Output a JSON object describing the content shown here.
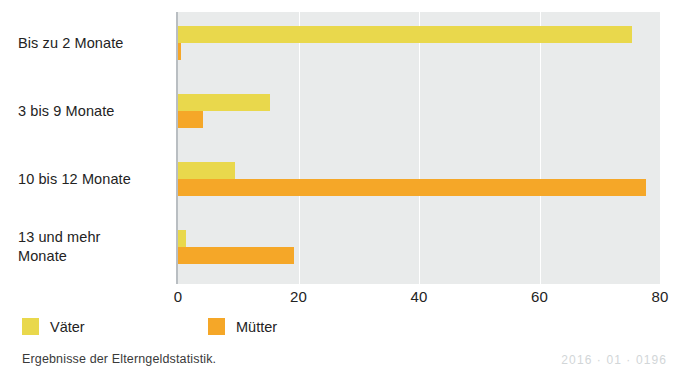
{
  "chart_data": {
    "type": "bar",
    "orientation": "horizontal",
    "title": "",
    "xlabel": "",
    "ylabel": "",
    "categories": [
      "Bis zu 2 Monate",
      "3 bis 9 Monate",
      "10 bis 12 Monate",
      "13 und mehr\nMonate"
    ],
    "series": [
      {
        "name": "Väter",
        "color": "#e9d84c",
        "values": [
          75.3,
          15.2,
          9.5,
          1.3
        ]
      },
      {
        "name": "Mütter",
        "color": "#f5a728",
        "values": [
          0.5,
          4.2,
          77.7,
          19.2
        ]
      }
    ],
    "xlim": [
      0,
      80
    ],
    "xticks": [
      "0",
      "20",
      "40",
      "60",
      "80"
    ],
    "xtick_values": [
      0,
      20,
      40,
      60,
      80
    ],
    "grid": true,
    "legend_position": "bottom-left",
    "plot_background": "#e9ebeb",
    "gridline_color": "#ffffff"
  },
  "category_lines": [
    [
      "Bis zu 2 Monate"
    ],
    [
      "3 bis 9 Monate"
    ],
    [
      "10 bis 12 Monate"
    ],
    [
      "13 und mehr",
      "Monate"
    ]
  ],
  "legend": {
    "items": [
      {
        "label": "Väter",
        "color": "#e9d84c"
      },
      {
        "label": "Mütter",
        "color": "#f5a728"
      }
    ]
  },
  "footer": {
    "source": "Ergebnisse der Elterngeldstatistik.",
    "code": "2016 · 01 · 0196"
  }
}
